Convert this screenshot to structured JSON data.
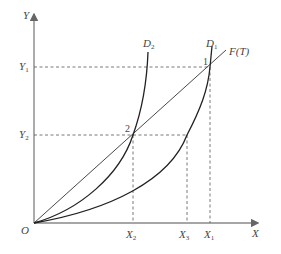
{
  "diagram": {
    "axes": {
      "y_label": "Y",
      "x_label": "X",
      "origin_label": "O"
    },
    "y_ticks": [
      {
        "base": "Y",
        "sub": "1"
      },
      {
        "base": "Y",
        "sub": "2"
      }
    ],
    "x_ticks": [
      {
        "base": "X",
        "sub": "2"
      },
      {
        "base": "X",
        "sub": "3"
      },
      {
        "base": "X",
        "sub": "1"
      }
    ],
    "curves": [
      {
        "base": "D",
        "sub": "2"
      },
      {
        "base": "D",
        "sub": "1"
      }
    ],
    "line_label": "F(T)",
    "points": [
      "1",
      "2"
    ],
    "colors": {
      "axis": "#888888",
      "curve": "#222222",
      "dash": "#555555",
      "text": "#444444"
    }
  }
}
